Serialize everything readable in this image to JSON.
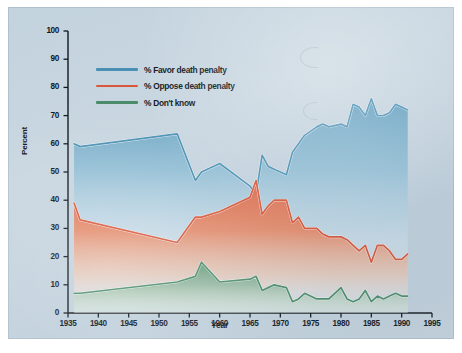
{
  "chart_data": {
    "type": "area",
    "title": "",
    "xlabel": "Year",
    "ylabel": "Percent",
    "xlim": [
      1935,
      1995
    ],
    "ylim": [
      0,
      100
    ],
    "grid": false,
    "legend_position": "top-left",
    "xticks": [
      "1935",
      "1940",
      "1945",
      "1950",
      "1955",
      "1960",
      "1965",
      "1970",
      "1975",
      "1980",
      "1985",
      "1990",
      "1995"
    ],
    "yticks": [
      "0",
      "10",
      "20",
      "30",
      "40",
      "50",
      "60",
      "70",
      "80",
      "90",
      "100"
    ],
    "note": "Overlapping (non-stacked) filled area curves; each series fills from its own line down to y=0 with a top-to-bottom fading gradient.",
    "series": [
      {
        "name": "% Favor death penalty",
        "color": "#4a90b4",
        "fill_top": "#5d9cbd",
        "x": [
          1936,
          1937,
          1953,
          1956,
          1957,
          1960,
          1965,
          1966,
          1967,
          1968,
          1969,
          1971,
          1972,
          1973,
          1974,
          1976,
          1977,
          1978,
          1980,
          1981,
          1982,
          1983,
          1984,
          1985,
          1986,
          1987,
          1988,
          1989,
          1990,
          1991
        ],
        "y": [
          60,
          59,
          63.5,
          47,
          50,
          53,
          45,
          42,
          56,
          52,
          51,
          49,
          57,
          60,
          63,
          66,
          67,
          66,
          67,
          66,
          74,
          73,
          70,
          76,
          70,
          70,
          71,
          74,
          73,
          72
        ]
      },
      {
        "name": "% Oppose death penalty",
        "color": "#d9573a",
        "fill_top": "#e06646",
        "x": [
          1936,
          1937,
          1953,
          1956,
          1957,
          1960,
          1965,
          1966,
          1967,
          1968,
          1969,
          1971,
          1972,
          1973,
          1974,
          1976,
          1977,
          1978,
          1980,
          1981,
          1982,
          1983,
          1984,
          1985,
          1986,
          1987,
          1988,
          1989,
          1990,
          1991
        ],
        "y": [
          39,
          33,
          25,
          34,
          34,
          36,
          41,
          47,
          35,
          38,
          40,
          40,
          32,
          34,
          30,
          30,
          28,
          27,
          27,
          26,
          24,
          22,
          24,
          18,
          24,
          24,
          22,
          19,
          19,
          21
        ]
      },
      {
        "name": "% Don't know",
        "color": "#4a8c6a",
        "fill_top": "#5e9a78",
        "x": [
          1936,
          1937,
          1953,
          1956,
          1957,
          1960,
          1965,
          1966,
          1967,
          1968,
          1969,
          1971,
          1972,
          1973,
          1974,
          1976,
          1977,
          1978,
          1980,
          1981,
          1982,
          1983,
          1984,
          1985,
          1986,
          1987,
          1988,
          1989,
          1990,
          1991
        ],
        "y": [
          7,
          7,
          11,
          13,
          18,
          11,
          12,
          13,
          8,
          9,
          10,
          9,
          4,
          5,
          7,
          5,
          5,
          5,
          9,
          5,
          4,
          5,
          8,
          4,
          6,
          5,
          6,
          7,
          6,
          6
        ]
      }
    ]
  },
  "legend": {
    "items": [
      {
        "label": "% Favor death penalty",
        "color": "#4a90b4"
      },
      {
        "label": "% Oppose death penalty",
        "color": "#d9573a"
      },
      {
        "label": "% Don't know",
        "color": "#4a8c6a"
      }
    ]
  },
  "axes": {
    "y_title": "Percent",
    "x_title": "Year"
  }
}
